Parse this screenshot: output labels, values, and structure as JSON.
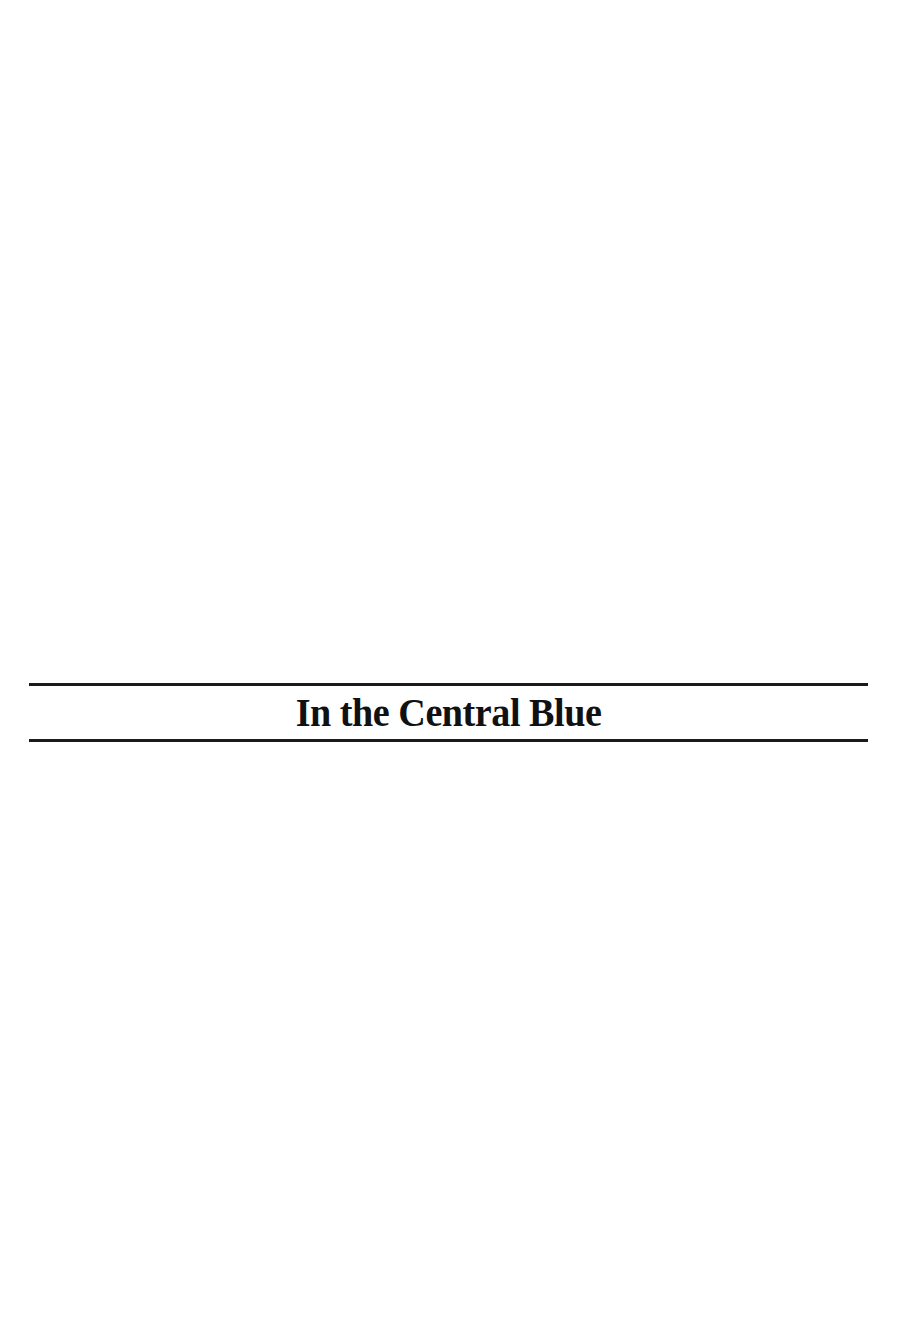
{
  "page": {
    "title": "In the Central Blue"
  }
}
